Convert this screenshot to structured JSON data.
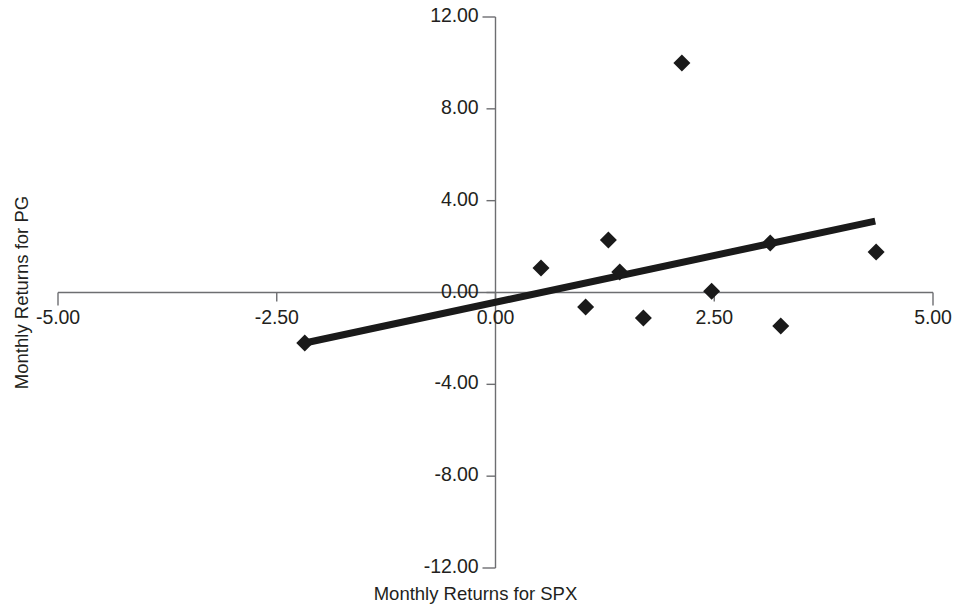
{
  "chart_data": {
    "type": "scatter",
    "title": "",
    "xlabel": "Monthly Returns for SPX",
    "ylabel": "Monthly Returns for PG",
    "xlim": [
      -5.0,
      5.0
    ],
    "ylim": [
      -12.0,
      12.0
    ],
    "xticks": [
      "-5.00",
      "-2.50",
      "0.00",
      "2.50",
      "5.00"
    ],
    "xtick_values": [
      -5.0,
      -2.5,
      0.0,
      2.5,
      5.0
    ],
    "yticks": [
      "12.00",
      "8.00",
      "4.00",
      "0.00",
      "-4.00",
      "-8.00",
      "-12.00"
    ],
    "ytick_values": [
      12.0,
      8.0,
      4.0,
      0.0,
      -4.0,
      -8.0,
      -12.0
    ],
    "grid": false,
    "legend": "none",
    "marker": "diamond",
    "marker_color": "#1a1a1a",
    "axis_color": "#6d6e71",
    "series": [
      {
        "name": "Monthly Returns PG vs SPX",
        "points": [
          [
            -2.18,
            -2.2
          ],
          [
            0.52,
            1.07
          ],
          [
            1.03,
            -0.63
          ],
          [
            1.29,
            2.29
          ],
          [
            1.42,
            0.89
          ],
          [
            1.69,
            -1.11
          ],
          [
            2.13,
            10.0
          ],
          [
            2.47,
            0.05
          ],
          [
            3.14,
            2.16
          ],
          [
            3.26,
            -1.46
          ],
          [
            4.35,
            1.76
          ]
        ]
      }
    ],
    "trendline": {
      "type": "linear",
      "color": "#1a1a1a",
      "x_start": -2.18,
      "y_start": -2.2,
      "x_end": 4.34,
      "y_end": 3.11
    }
  }
}
